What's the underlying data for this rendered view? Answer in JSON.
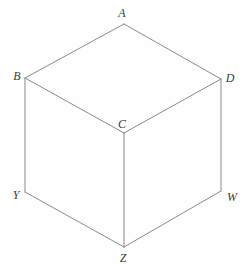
{
  "figure": {
    "type": "geometry-diagram",
    "background_color": "#fefefe",
    "stroke_color": "#8a8a8a",
    "label_color": "#3a3a3a",
    "stroke_width": 1,
    "canvas": {
      "width": 251,
      "height": 276
    }
  },
  "vertices": [
    {
      "id": "A",
      "label": "A",
      "x": 124,
      "y": 24,
      "label_x": 122,
      "label_y": 13,
      "role": "top-apex"
    },
    {
      "id": "B",
      "label": "B",
      "x": 25,
      "y": 78,
      "label_x": 17,
      "label_y": 76,
      "role": "top-left"
    },
    {
      "id": "D",
      "label": "D",
      "x": 221,
      "y": 79,
      "label_x": 230,
      "label_y": 78,
      "role": "top-right"
    },
    {
      "id": "C",
      "label": "C",
      "x": 124,
      "y": 133,
      "label_x": 122,
      "label_y": 124,
      "role": "center-front"
    },
    {
      "id": "Y",
      "label": "Y",
      "x": 25,
      "y": 192,
      "label_x": 16,
      "label_y": 195,
      "role": "bottom-left"
    },
    {
      "id": "W",
      "label": "W",
      "x": 221,
      "y": 191,
      "label_x": 232,
      "label_y": 197,
      "role": "bottom-right"
    },
    {
      "id": "Z",
      "label": "Z",
      "x": 124,
      "y": 247,
      "label_x": 123,
      "label_y": 258,
      "role": "bottom-apex"
    }
  ],
  "edges": [
    {
      "id": "AB",
      "from": "A",
      "to": "B",
      "x1": 124,
      "y1": 24,
      "x2": 25,
      "y2": 78
    },
    {
      "id": "AD",
      "from": "A",
      "to": "D",
      "x1": 124,
      "y1": 24,
      "x2": 221,
      "y2": 79
    },
    {
      "id": "BC",
      "from": "B",
      "to": "C",
      "x1": 25,
      "y1": 78,
      "x2": 124,
      "y2": 133
    },
    {
      "id": "CD",
      "from": "C",
      "to": "D",
      "x1": 124,
      "y1": 133,
      "x2": 221,
      "y2": 79
    },
    {
      "id": "BY",
      "from": "B",
      "to": "Y",
      "x1": 25,
      "y1": 78,
      "x2": 25,
      "y2": 192
    },
    {
      "id": "CZ",
      "from": "C",
      "to": "Z",
      "x1": 124,
      "y1": 133,
      "x2": 124,
      "y2": 247
    },
    {
      "id": "DW",
      "from": "D",
      "to": "W",
      "x1": 221,
      "y1": 79,
      "x2": 221,
      "y2": 191
    },
    {
      "id": "YZ",
      "from": "Y",
      "to": "Z",
      "x1": 25,
      "y1": 192,
      "x2": 124,
      "y2": 247
    },
    {
      "id": "ZW",
      "from": "Z",
      "to": "W",
      "x1": 124,
      "y1": 247,
      "x2": 221,
      "y2": 191
    }
  ]
}
